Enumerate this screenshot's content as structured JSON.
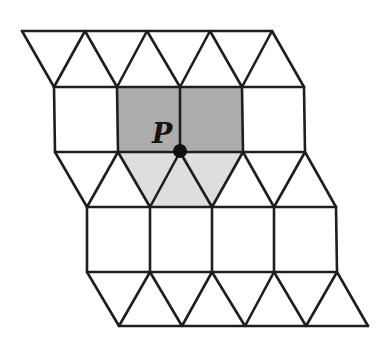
{
  "diagram": {
    "type": "semi-regular tiling (squares and equilateral triangles)",
    "point_label": "P",
    "colors": {
      "background": "#ffffff",
      "edge": "#1e1e1e",
      "dark_shade": "#acacac",
      "light_shade": "#dedede",
      "point": "#111111"
    },
    "rows_y": [
      31,
      87,
      152,
      207,
      272,
      326
    ],
    "rows_x": [
      [
        22,
        85,
        147,
        210,
        272
      ],
      [
        54,
        117,
        180,
        242,
        304
      ],
      [
        55,
        118,
        180,
        243,
        305
      ],
      [
        87,
        150,
        212,
        274,
        336
      ],
      [
        87,
        150,
        212,
        274,
        337
      ],
      [
        119,
        182,
        245,
        306,
        368
      ]
    ],
    "point": {
      "x": 180,
      "y": 152
    },
    "shaded_regions": [
      {
        "name": "two-squares-above-P",
        "shade": "dark",
        "points": "118,87 242,87 243,152 118,152"
      },
      {
        "name": "three-triangles-below-P",
        "shade": "light",
        "points": "118,152 243,152 212,207 150,207"
      }
    ]
  }
}
